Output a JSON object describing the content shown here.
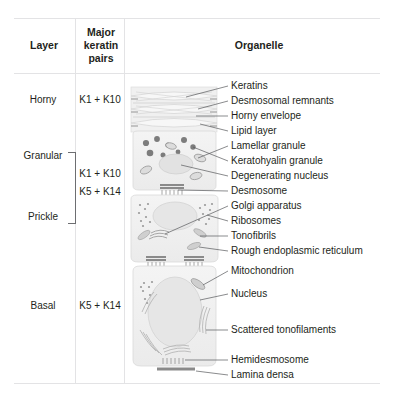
{
  "figure": {
    "border_color": "#e3e3e5",
    "text_color": "#231f20",
    "leader_color": "#58595b",
    "cell_fill": "#f2f2f2",
    "cell_stroke": "#d9d9d9",
    "organelle_dark": "#808285"
  },
  "table": {
    "headers": {
      "layer": "Layer",
      "keratin": "Major\nkeratin\npairs",
      "keratin_line1": "Major",
      "keratin_line2": "keratin",
      "keratin_line3": "pairs",
      "organelle": "Organelle"
    }
  },
  "layers": [
    {
      "name": "Horny",
      "keratin": "K1 + K10"
    },
    {
      "name": "Granular",
      "keratin": ""
    },
    {
      "name": "Prickle",
      "keratin": ""
    },
    {
      "name": "Basal",
      "keratin": "K5 + K14"
    }
  ],
  "bracket_keratins": {
    "line1": "K1 + K10",
    "line2": "K5 + K14"
  },
  "organelles": [
    {
      "label": "Keratins",
      "y": 86
    },
    {
      "label": "Desmosomal remnants",
      "y": 101
    },
    {
      "label": "Horny envelope",
      "y": 116
    },
    {
      "label": "Lipid layer",
      "y": 131
    },
    {
      "label": "Lamellar granule",
      "y": 146
    },
    {
      "label": "Keratohyalin granule",
      "y": 161
    },
    {
      "label": "Degenerating nucleus",
      "y": 176
    },
    {
      "label": "Desmosome",
      "y": 191
    },
    {
      "label": "Golgi apparatus",
      "y": 206
    },
    {
      "label": "Ribosomes",
      "y": 221
    },
    {
      "label": "Tonofibrils",
      "y": 236
    },
    {
      "label": "Rough endoplasmic reticulum",
      "y": 251
    },
    {
      "label": "Mitochondrion",
      "y": 271
    },
    {
      "label": "Nucleus",
      "y": 294
    },
    {
      "label": "Scattered tonofilaments",
      "y": 330
    },
    {
      "label": "Hemidesmosome",
      "y": 360
    },
    {
      "label": "Lamina densa",
      "y": 375
    }
  ]
}
